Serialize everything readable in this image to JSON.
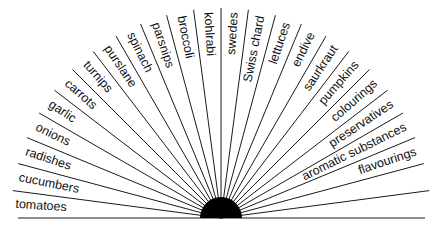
{
  "diagram": {
    "type": "fan",
    "center": {
      "x": 221,
      "y": 218
    },
    "hub_radius": 21,
    "ray_length": 210,
    "sector_deg": 7.5,
    "colors": {
      "line": "#1a1a1a",
      "hub": "#000000",
      "text": "#111111"
    },
    "labels": [
      "tomatoes",
      "cucumbers",
      "radishes",
      "onions",
      "garlic",
      "carrots",
      "turnips",
      "purslane",
      "spinach",
      "parsnips",
      "broccoli",
      "kohlrabi",
      "swedes",
      "Swiss chard",
      "lettuces",
      "endive",
      "saurkraut",
      "pumpkins",
      "colourings",
      "preservatives",
      "aromatic substances",
      "flavourings",
      "",
      ""
    ]
  }
}
